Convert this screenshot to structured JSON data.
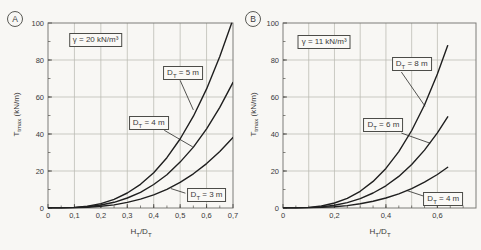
{
  "figure": {
    "background": "#f8f7f4",
    "grid_color": "#b9b9b2",
    "border_color": "#7d7d78",
    "curve_color": "#1f1f1f",
    "text_color": "#3a3a3a"
  },
  "chart_data": [
    {
      "type": "line",
      "panel_label": "A",
      "gamma_label": "γ = 20 kN/m³",
      "ylabel": {
        "main": "T",
        "sub": "tmax",
        "unit": " (kN/m)"
      },
      "xlabel": {
        "p1": "H",
        "s1": "T",
        "p2": "/D",
        "s2": "T"
      },
      "x_axis": {
        "min": 0,
        "max": 0.7,
        "grid_step": 0.1,
        "grid_max": 0.6,
        "minor_step": 0.05,
        "ticks": [
          {
            "v": 0,
            "label": "0"
          },
          {
            "v": 0.1,
            "label": "0,1"
          },
          {
            "v": 0.2,
            "label": "0,2"
          },
          {
            "v": 0.3,
            "label": "0,3"
          },
          {
            "v": 0.4,
            "label": "0,4"
          },
          {
            "v": 0.5,
            "label": "0,5"
          },
          {
            "v": 0.6,
            "label": "0,6"
          },
          {
            "v": 0.7,
            "label": "0,7"
          }
        ]
      },
      "y_axis": {
        "min": 0,
        "max": 100,
        "grid_step": 20,
        "minor_step": 10,
        "ticks": [
          {
            "v": 0,
            "label": "0"
          },
          {
            "v": 20,
            "label": "20"
          },
          {
            "v": 40,
            "label": "40"
          },
          {
            "v": 60,
            "label": "60"
          },
          {
            "v": 80,
            "label": "80"
          },
          {
            "v": 100,
            "label": "100"
          }
        ]
      },
      "gamma_box": [
        0.18,
        91
      ],
      "series": [
        {
          "name": "DT = 5 m",
          "points": [
            [
              0,
              0
            ],
            [
              0.05,
              0
            ],
            [
              0.1,
              0.3
            ],
            [
              0.15,
              1
            ],
            [
              0.2,
              2.4
            ],
            [
              0.25,
              4.7
            ],
            [
              0.3,
              8.1
            ],
            [
              0.35,
              12.8
            ],
            [
              0.4,
              19.1
            ],
            [
              0.45,
              27.2
            ],
            [
              0.5,
              37.3
            ],
            [
              0.55,
              49.6
            ],
            [
              0.6,
              64.4
            ],
            [
              0.65,
              81.9
            ],
            [
              0.695,
              100
            ]
          ]
        },
        {
          "name": "DT = 4 m",
          "points": [
            [
              0,
              0
            ],
            [
              0.05,
              0
            ],
            [
              0.1,
              0.2
            ],
            [
              0.15,
              0.7
            ],
            [
              0.2,
              1.6
            ],
            [
              0.25,
              3.1
            ],
            [
              0.3,
              5.4
            ],
            [
              0.35,
              8.5
            ],
            [
              0.4,
              12.7
            ],
            [
              0.45,
              18
            ],
            [
              0.5,
              24.8
            ],
            [
              0.55,
              32.9
            ],
            [
              0.6,
              42.8
            ],
            [
              0.65,
              54.4
            ],
            [
              0.7,
              67.9
            ]
          ]
        },
        {
          "name": "DT = 3 m",
          "points": [
            [
              0,
              0
            ],
            [
              0.05,
              0
            ],
            [
              0.1,
              0.1
            ],
            [
              0.15,
              0.4
            ],
            [
              0.2,
              0.9
            ],
            [
              0.25,
              1.7
            ],
            [
              0.3,
              3
            ],
            [
              0.35,
              4.8
            ],
            [
              0.4,
              7.1
            ],
            [
              0.45,
              10.1
            ],
            [
              0.5,
              13.9
            ],
            [
              0.55,
              18.5
            ],
            [
              0.6,
              24
            ],
            [
              0.65,
              30.5
            ],
            [
              0.7,
              38.1
            ]
          ]
        }
      ],
      "annotations": [
        {
          "pre": "D",
          "sub": "T",
          "post": " = 5 m",
          "box": [
            0.511,
            73
          ],
          "leader": {
            "from": [
              0.5,
              69
            ],
            "to": [
              0.55,
              53
            ]
          }
        },
        {
          "pre": "D",
          "sub": "T",
          "post": " = 4 m",
          "box": [
            0.381,
            45.7
          ],
          "leader": {
            "from": [
              0.44,
              42
            ],
            "to": [
              0.548,
              33
            ]
          }
        },
        {
          "pre": "D",
          "sub": "T",
          "post": " = 3 m",
          "box": [
            0.6,
            7
          ],
          "leader": {
            "from": [
              0.52,
              8
            ],
            "to": [
              0.465,
              10.5
            ]
          }
        }
      ]
    },
    {
      "type": "line",
      "panel_label": "B",
      "gamma_label": "γ = 11 kN/m³",
      "ylabel": {
        "main": "T",
        "sub": "tmax",
        "unit": " (kN/m)"
      },
      "xlabel": {
        "p1": "H",
        "s1": "T",
        "p2": "/D",
        "s2": "T"
      },
      "x_axis": {
        "min": 0,
        "max": 0.75,
        "grid_step": 0.1,
        "grid_max": 0.6,
        "minor_step": 0.05,
        "ticks": [
          {
            "v": 0,
            "label": "0"
          },
          {
            "v": 0.2,
            "label": "0,2"
          },
          {
            "v": 0.4,
            "label": "0,4"
          },
          {
            "v": 0.6,
            "label": "0,6"
          }
        ]
      },
      "y_axis": {
        "min": 0,
        "max": 100,
        "grid_step": 20,
        "minor_step": 10,
        "ticks": [
          {
            "v": 0,
            "label": "0"
          },
          {
            "v": 20,
            "label": "20"
          },
          {
            "v": 40,
            "label": "40"
          },
          {
            "v": 60,
            "label": "60"
          },
          {
            "v": 80,
            "label": "80"
          },
          {
            "v": 100,
            "label": "100"
          }
        ]
      },
      "gamma_box": [
        0.16,
        89.5
      ],
      "series": [
        {
          "name": "DT = 8 m",
          "points": [
            [
              0,
              0
            ],
            [
              0.05,
              0
            ],
            [
              0.1,
              0.3
            ],
            [
              0.15,
              1.1
            ],
            [
              0.2,
              2.7
            ],
            [
              0.25,
              5.2
            ],
            [
              0.3,
              9
            ],
            [
              0.35,
              14.4
            ],
            [
              0.4,
              21.4
            ],
            [
              0.45,
              30.5
            ],
            [
              0.5,
              41.9
            ],
            [
              0.55,
              55.7
            ],
            [
              0.6,
              72.4
            ],
            [
              0.64,
              87.8
            ]
          ]
        },
        {
          "name": "DT = 6 m",
          "points": [
            [
              0,
              0
            ],
            [
              0.05,
              0
            ],
            [
              0.1,
              0.2
            ],
            [
              0.15,
              0.6
            ],
            [
              0.2,
              1.5
            ],
            [
              0.25,
              2.9
            ],
            [
              0.3,
              5.1
            ],
            [
              0.35,
              8.1
            ],
            [
              0.4,
              12
            ],
            [
              0.45,
              17.1
            ],
            [
              0.5,
              23.5
            ],
            [
              0.55,
              31.3
            ],
            [
              0.6,
              40.6
            ],
            [
              0.64,
              49.3
            ]
          ]
        },
        {
          "name": "DT = 4 m",
          "points": [
            [
              0,
              0
            ],
            [
              0.05,
              0
            ],
            [
              0.1,
              0.1
            ],
            [
              0.15,
              0.3
            ],
            [
              0.2,
              0.7
            ],
            [
              0.25,
              1.3
            ],
            [
              0.3,
              2.3
            ],
            [
              0.35,
              3.6
            ],
            [
              0.4,
              5.4
            ],
            [
              0.45,
              7.7
            ],
            [
              0.5,
              10.5
            ],
            [
              0.55,
              14
            ],
            [
              0.6,
              18.1
            ],
            [
              0.64,
              22
            ]
          ]
        }
      ],
      "annotations": [
        {
          "pre": "D",
          "sub": "T",
          "post": " = 8 m",
          "box": [
            0.5,
            77.6
          ],
          "leader": {
            "from": [
              0.46,
              73.5
            ],
            "to": [
              0.552,
              55
            ]
          }
        },
        {
          "pre": "D",
          "sub": "T",
          "post": " = 6 m",
          "box": [
            0.39,
            44.6
          ],
          "leader": {
            "from": [
              0.46,
              40.5
            ],
            "to": [
              0.572,
              35
            ]
          }
        },
        {
          "pre": "D",
          "sub": "T",
          "post": " = 4 m",
          "box": [
            0.623,
            5.1
          ],
          "leader": {
            "from": [
              0.545,
              6.5
            ],
            "to": [
              0.48,
              9.5
            ]
          }
        }
      ]
    }
  ]
}
